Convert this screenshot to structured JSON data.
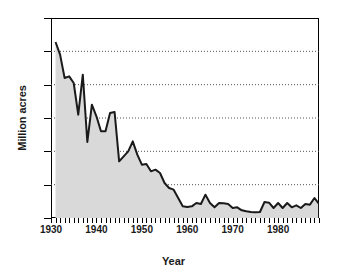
{
  "chart_data": {
    "type": "area",
    "title": "",
    "xlabel": "Year",
    "ylabel": "Million acres",
    "xlim": [
      1930,
      1989
    ],
    "ylim": [
      0,
      60
    ],
    "grid": "horizontal-dotted",
    "legend": "none",
    "fill_color": "#d9d9d9",
    "line_color": "#1a1a1a",
    "x_tick_labels": [
      "1930",
      "1940",
      "1950",
      "1960",
      "1970",
      "1980"
    ],
    "x_tick_label_values": [
      1930,
      1940,
      1950,
      1960,
      1970,
      1980
    ],
    "y_tick_labels": [
      "0",
      "10",
      "20",
      "30",
      "40",
      "50",
      "60"
    ],
    "y_tick_label_values": [
      0,
      10,
      20,
      30,
      40,
      50,
      60
    ],
    "x": [
      1931,
      1932,
      1933,
      1934,
      1935,
      1936,
      1937,
      1938,
      1939,
      1940,
      1941,
      1942,
      1943,
      1944,
      1945,
      1946,
      1947,
      1948,
      1949,
      1950,
      1951,
      1952,
      1953,
      1954,
      1955,
      1956,
      1957,
      1958,
      1959,
      1960,
      1961,
      1962,
      1963,
      1964,
      1965,
      1966,
      1967,
      1968,
      1969,
      1970,
      1971,
      1972,
      1973,
      1974,
      1975,
      1976,
      1977,
      1978,
      1979,
      1980,
      1981,
      1982,
      1983,
      1984,
      1985,
      1986,
      1987,
      1988,
      1989
    ],
    "values": [
      52.8,
      49.0,
      42.0,
      42.5,
      40.5,
      31.0,
      43.0,
      22.8,
      34.0,
      30.5,
      26.0,
      26.0,
      31.5,
      31.8,
      17.0,
      18.5,
      20.0,
      23.0,
      19.0,
      16.0,
      16.2,
      14.0,
      14.5,
      13.5,
      10.5,
      9.0,
      8.5,
      6.0,
      3.5,
      3.3,
      3.5,
      4.5,
      4.2,
      7.0,
      4.5,
      3.2,
      4.5,
      4.4,
      4.2,
      3.0,
      3.2,
      2.3,
      2.0,
      1.8,
      1.7,
      1.8,
      4.8,
      4.6,
      3.0,
      4.5,
      3.0,
      4.5,
      3.2,
      3.8,
      3.0,
      4.2,
      4.0,
      6.0,
      4.2
    ]
  },
  "axes": {
    "y_title": "Million acres",
    "x_title": "Year"
  }
}
